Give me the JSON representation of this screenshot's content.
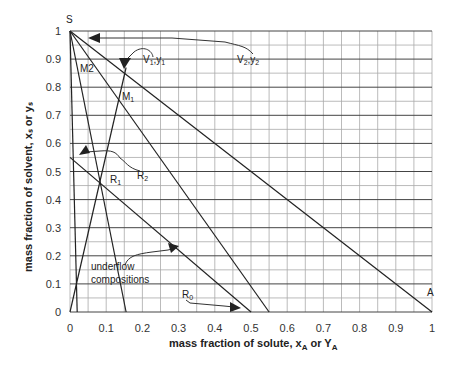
{
  "chart_data": {
    "type": "line",
    "title": "",
    "xlabel": "mass fraction of solute, x_A or Y_A",
    "ylabel": "mass fraction of solvent, x_s or y_s",
    "xlim": [
      0,
      1
    ],
    "ylim": [
      0,
      1
    ],
    "grid": true,
    "x_ticks": [
      "0",
      "0.1",
      "0.2",
      "0.3",
      "0.4",
      "0.5",
      "0.6",
      "0.7",
      "0.8",
      "0.9",
      "1"
    ],
    "y_ticks": [
      "0",
      "0.1",
      "0.2",
      "0.3",
      "0.4",
      "0.5",
      "0.6",
      "0.7",
      "0.8",
      "0.9",
      "1"
    ],
    "series": [
      {
        "name": "S-A (overflow line)",
        "points": [
          [
            0,
            1
          ],
          [
            1,
            0
          ]
        ]
      },
      {
        "name": "S-M1 line",
        "points": [
          [
            0,
            1
          ],
          [
            0.55,
            0
          ]
        ]
      },
      {
        "name": "S-R1 line",
        "points": [
          [
            0,
            1
          ],
          [
            0.155,
            0
          ]
        ]
      },
      {
        "name": "S-M2 line",
        "points": [
          [
            0,
            1
          ],
          [
            0.02,
            0
          ]
        ]
      },
      {
        "name": "underflow compositions",
        "points": [
          [
            0,
            0.55
          ],
          [
            0.5,
            0
          ]
        ]
      },
      {
        "name": "origin-V1 line",
        "points": [
          [
            0,
            0
          ],
          [
            0.155,
            0.87
          ]
        ]
      }
    ],
    "annotations": [
      {
        "text": "S",
        "x": 0,
        "y": 1.03
      },
      {
        "text": "A",
        "x": 0.98,
        "y": 0.04
      },
      {
        "text": "M2",
        "x": 0.03,
        "y": 0.87
      },
      {
        "text": "M1",
        "x": 0.15,
        "y": 0.72
      },
      {
        "text": "V1,y1",
        "x": 0.19,
        "y": 0.9
      },
      {
        "text": "V2,y2",
        "x": 0.7,
        "y": 0.9
      },
      {
        "text": "R1",
        "x": 0.09,
        "y": 0.46
      },
      {
        "text": "R2",
        "x": 0.16,
        "y": 0.48
      },
      {
        "text": "R0",
        "x": 0.31,
        "y": 0.03
      },
      {
        "text": "underflow compositions",
        "x": 0.06,
        "y": 0.17
      }
    ]
  },
  "labels": {
    "S": "S",
    "A": "A",
    "M2": "M2",
    "M1": "M",
    "M1_sub": "1",
    "V1": "V",
    "V1_sub": "1",
    "V1_sep": ",y",
    "V2": "V",
    "V2_sub": "2",
    "V2_sep": ",y",
    "R1": "R",
    "R1_sub": "1",
    "R2": "R",
    "R2_sub": "2",
    "R0": "R",
    "R0_sub": "0",
    "underflow_1": "underflow",
    "underflow_2": "compositions",
    "xlabel_main": "mass fraction of solute, x",
    "xlabel_sub1": "A",
    "xlabel_mid": " or Y",
    "xlabel_sub2": "A",
    "ylabel": "mass fraction of solvent, xₛ or yₛ"
  }
}
